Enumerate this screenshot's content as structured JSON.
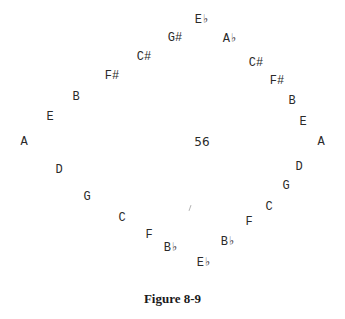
{
  "figure": {
    "caption": "Figure 8-9",
    "center_label": "56",
    "notes": [
      {
        "label": "E♭",
        "x": 202,
        "y": 20
      },
      {
        "label": "G#",
        "x": 175,
        "y": 38
      },
      {
        "label": "A♭",
        "x": 230,
        "y": 39
      },
      {
        "label": "C#",
        "x": 144,
        "y": 57
      },
      {
        "label": "C#",
        "x": 256,
        "y": 63
      },
      {
        "label": "F#",
        "x": 112,
        "y": 76
      },
      {
        "label": "F#",
        "x": 277,
        "y": 81
      },
      {
        "label": "B",
        "x": 76,
        "y": 97
      },
      {
        "label": "B",
        "x": 292,
        "y": 101
      },
      {
        "label": "E",
        "x": 50,
        "y": 117
      },
      {
        "label": "E",
        "x": 303,
        "y": 122
      },
      {
        "label": "A",
        "x": 24,
        "y": 142
      },
      {
        "label": "A",
        "x": 321,
        "y": 142
      },
      {
        "label": "D",
        "x": 59,
        "y": 170
      },
      {
        "label": "D",
        "x": 299,
        "y": 167
      },
      {
        "label": "G",
        "x": 87,
        "y": 197
      },
      {
        "label": "G",
        "x": 286,
        "y": 186
      },
      {
        "label": "C",
        "x": 122,
        "y": 218
      },
      {
        "label": "C",
        "x": 269,
        "y": 207
      },
      {
        "label": "F",
        "x": 149,
        "y": 235
      },
      {
        "label": "F",
        "x": 249,
        "y": 222
      },
      {
        "label": "B♭",
        "x": 171,
        "y": 248
      },
      {
        "label": "B♭",
        "x": 228,
        "y": 242
      },
      {
        "label": "E♭",
        "x": 204,
        "y": 263
      }
    ],
    "center": {
      "x": 202,
      "y": 142
    },
    "mark": {
      "x": 190,
      "y": 208
    }
  }
}
